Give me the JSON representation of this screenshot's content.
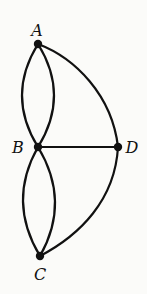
{
  "diagram": {
    "type": "multigraph",
    "nodes": [
      {
        "id": "A",
        "label": "A",
        "x": 38,
        "y": 44,
        "label_x": 37,
        "label_y": 36
      },
      {
        "id": "B",
        "label": "B",
        "x": 38,
        "y": 147,
        "label_x": 18,
        "label_y": 153
      },
      {
        "id": "C",
        "label": "C",
        "x": 40,
        "y": 256,
        "label_x": 40,
        "label_y": 280
      },
      {
        "id": "D",
        "label": "D",
        "x": 118,
        "y": 147,
        "label_x": 132,
        "label_y": 153
      }
    ],
    "edges": [
      {
        "from": "A",
        "to": "B",
        "style": "curve-left"
      },
      {
        "from": "A",
        "to": "B",
        "style": "curve-right"
      },
      {
        "from": "A",
        "to": "D",
        "style": "arc"
      },
      {
        "from": "B",
        "to": "D",
        "style": "straight"
      },
      {
        "from": "B",
        "to": "C",
        "style": "curve-left"
      },
      {
        "from": "B",
        "to": "C",
        "style": "curve-right"
      },
      {
        "from": "C",
        "to": "D",
        "style": "arc"
      }
    ]
  }
}
